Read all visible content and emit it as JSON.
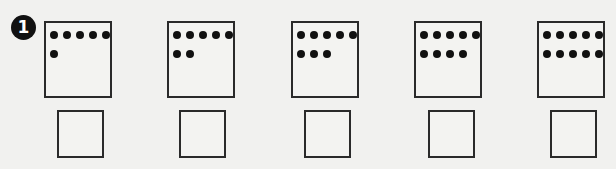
{
  "exercise": {
    "number": "1",
    "items": [
      {
        "dot_count": 6,
        "answer": ""
      },
      {
        "dot_count": 7,
        "answer": ""
      },
      {
        "dot_count": 8,
        "answer": ""
      },
      {
        "dot_count": 9,
        "answer": ""
      },
      {
        "dot_count": 10,
        "answer": ""
      }
    ]
  },
  "colors": {
    "ink": "#111111",
    "paper": "#f1f1ef"
  }
}
